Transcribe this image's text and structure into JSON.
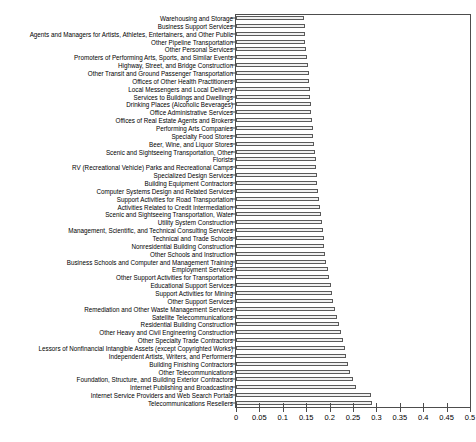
{
  "chart_data": {
    "type": "bar",
    "orientation": "horizontal",
    "title": "",
    "xlabel": "",
    "ylabel": "",
    "xlim": [
      0,
      0.5
    ],
    "grid": false,
    "legend": null,
    "xticks": [
      0,
      0.05,
      0.1,
      0.15,
      0.2,
      0.25,
      0.3,
      0.35,
      0.4,
      0.45,
      0.5
    ],
    "xtick_labels": [
      "0",
      "0.05",
      "0.1",
      "0.15",
      "0.2",
      "0.25",
      "0.3",
      "0.35",
      "0.4",
      "0.45",
      "0.5"
    ],
    "bar_facecolor": "#f0f0f0",
    "bar_edgecolor": "#5a5a5a",
    "categories": [
      "Warehousing and Storage",
      "Business Support Services",
      "Agents and Managers for Artists, Athletes, Entertainers, and Other Public",
      "Other Pipeline Transportation",
      "Other Personal Services",
      "Promoters of Performing Arts, Sports, and Similar Events",
      "Highway, Street, and Bridge Construction",
      "Other Transit and Ground Passenger Transportation",
      "Offices of Other Health Practitioners",
      "Local Messengers and Local Delivery",
      "Services to Buildings and Dwellings",
      "Drinking Places (Alcoholic Beverages)",
      "Office Administrative Services",
      "Offices of Real Estate Agents and Brokers",
      "Performing Arts Companies",
      "Specialty Food Stores",
      "Beer, Wine, and Liquor Stores",
      "Scenic and Sightseeing Transportation, Other",
      "Florists",
      "RV (Recreational Vehicle) Parks and Recreational Camps",
      "Specialized Design Services",
      "Building Equipment Contractors",
      "Computer Systems Design and Related Services",
      "Support Activities for Road Transportation",
      "Activities Related to Credit Intermediation",
      "Scenic and Sightseeing Transportation, Water",
      "Utility System Construction",
      "Management, Scientific, and Technical Consulting Services",
      "Technical and Trade Schools",
      "Nonresidential Building Construction",
      "Other Schools and Instruction",
      "Business Schools and Computer and Management Training",
      "Employment Services",
      "Other Support Activities for Transportation",
      "Educational Support Services",
      "Support Activities for Mining",
      "Other Support Services",
      "Remediation and Other Waste Management Services",
      "Satellite Telecommunications",
      "Residential Building Construction",
      "Other Heavy and Civil Engineering Construction",
      "Other Specialty Trade Contractors",
      "Lessors of Nonfinancial Intangible Assets (except Copyrighted Works)",
      "Independent Artists, Writers, and Performers",
      "Building Finishing Contractors",
      "Other Telecommunications",
      "Foundation, Structure, and Building Exterior Contractors",
      "Internet Publishing and Broadcasting",
      "Internet Service Providers and Web Search Portals",
      "Telecommunications Resellers"
    ],
    "values": [
      0.146,
      0.147,
      0.147,
      0.148,
      0.149,
      0.151,
      0.154,
      0.155,
      0.156,
      0.158,
      0.159,
      0.16,
      0.161,
      0.163,
      0.164,
      0.165,
      0.166,
      0.168,
      0.17,
      0.172,
      0.173,
      0.174,
      0.176,
      0.177,
      0.179,
      0.181,
      0.183,
      0.185,
      0.187,
      0.189,
      0.191,
      0.193,
      0.196,
      0.199,
      0.202,
      0.205,
      0.208,
      0.212,
      0.216,
      0.22,
      0.224,
      0.228,
      0.232,
      0.236,
      0.24,
      0.244,
      0.25,
      0.257,
      0.289,
      0.291
    ]
  }
}
